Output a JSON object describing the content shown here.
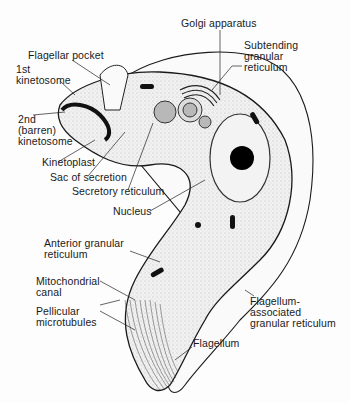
{
  "diagram": {
    "type": "labeled biological cross-section",
    "labels": {
      "golgi": "Golgi apparatus",
      "subtending": "Subtending\ngranular\nreticulum",
      "flagellar_pocket": "Flagellar pocket",
      "first_kinetosome": "1st\nkinetosome",
      "second_kinetosome": "2nd\n(barren)\nkinetosome",
      "kinetoplast": "Kinetoplast",
      "sac_secretion": "Sac of secretion",
      "secretory_reticulum": "Secretory reticulum",
      "nucleus": "Nucleus",
      "anterior_granular": "Anterior granular\nreticulum",
      "mitochondrial_canal": "Mitochondrial\ncanal",
      "pellicular": "Pellicular\nmicrotubules",
      "flagellum_assoc": "Flagellum-\nassociated\ngranular reticulum",
      "flagellum": "Flagellum"
    },
    "colors": {
      "line": "#1a1a1a",
      "fill_light": "#ececec",
      "fill_organelle": "#b8b8b8",
      "nucleolus": "#000000"
    }
  }
}
